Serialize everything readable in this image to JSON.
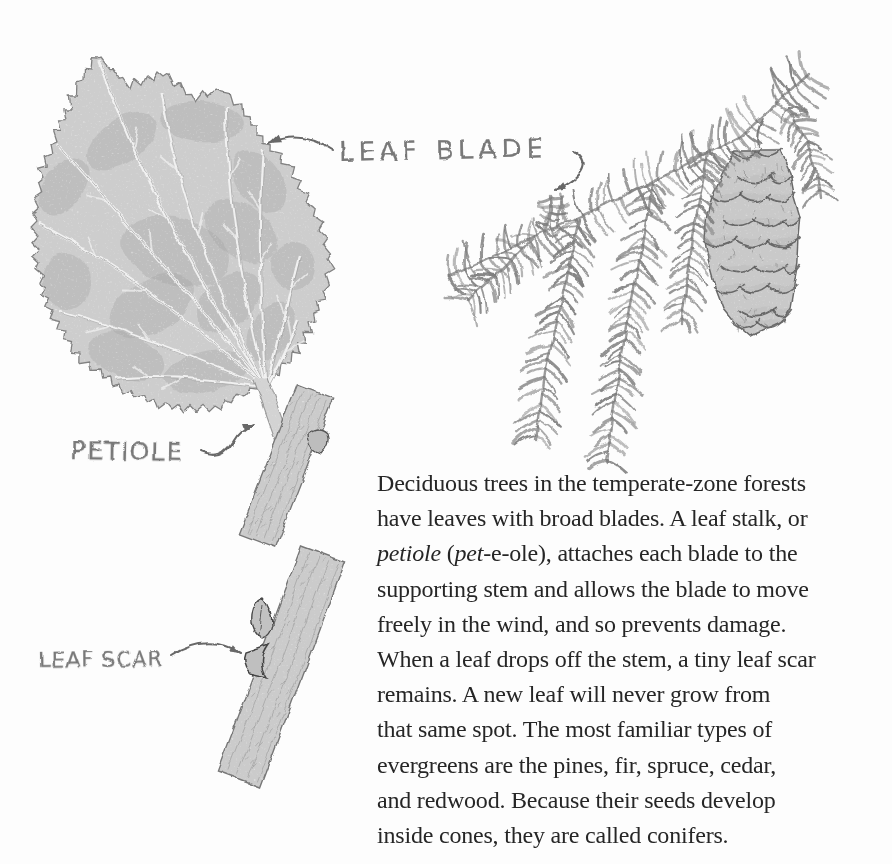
{
  "page": {
    "background": "#fdfdfd"
  },
  "colors": {
    "pencil_fill": "#cdcdcd",
    "pencil_shade": "#9f9f9f",
    "pencil_line": "#7a7a7a",
    "label_gray": "#787878",
    "text": "#262626"
  },
  "labels": {
    "leaf_blade": "LEAF BLADE",
    "petiole": "PETIOLE",
    "leaf_scar": "LEAF SCAR"
  },
  "figure": {
    "parts": [
      "leaf-blade",
      "petiole-on-twig",
      "twig-with-leaf-scar",
      "conifer-branch",
      "hanging-cone"
    ]
  },
  "paragraph": {
    "lines": [
      [
        {
          "t": "Deciduous trees in the temperate-zone forests"
        }
      ],
      [
        {
          "t": "have leaves with broad blades. A leaf stalk, or"
        }
      ],
      [
        {
          "t": "petiole",
          "i": true
        },
        {
          "t": " ("
        },
        {
          "t": "pet",
          "i": true
        },
        {
          "t": "-e-ole), attaches each blade to the"
        }
      ],
      [
        {
          "t": "supporting stem and allows the blade to move"
        }
      ],
      [
        {
          "t": "freely in the wind, and so prevents damage."
        }
      ],
      [
        {
          "t": "When a leaf drops off the stem, a tiny leaf scar"
        }
      ],
      [
        {
          "t": "remains. A new leaf will never grow from"
        }
      ],
      [
        {
          "t": "that same spot. The most familiar types of"
        }
      ],
      [
        {
          "t": "evergreens are the pines, fir, spruce, cedar,"
        }
      ],
      [
        {
          "t": "and redwood. Because their seeds develop"
        }
      ],
      [
        {
          "t": "inside cones, they are called conifers."
        }
      ]
    ]
  }
}
